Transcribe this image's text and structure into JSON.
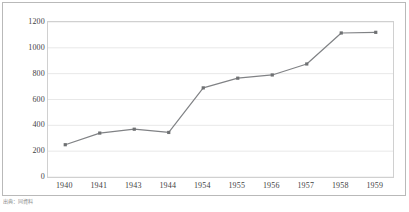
{
  "caption": "出典：同資料",
  "colors": {
    "series_line": "#808285",
    "marker": "#6f7173",
    "gridline": "#e8e8e8",
    "plot_border": "#d0d0d0",
    "figure_border": "#b9b9b9",
    "tick_text": "#3f3f3f",
    "background": "#ffffff"
  },
  "chart_data": {
    "type": "line",
    "title": "",
    "subtitle": "",
    "xlabel": "",
    "ylabel": "",
    "categories": [
      "1940",
      "1941",
      "1943",
      "1944",
      "1954",
      "1955",
      "1956",
      "1957",
      "1958",
      "1959"
    ],
    "values": [
      250,
      340,
      370,
      345,
      690,
      765,
      790,
      875,
      1115,
      1120
    ],
    "series": [
      {
        "name": "series-1",
        "values": [
          250,
          340,
          370,
          345,
          690,
          765,
          790,
          875,
          1115,
          1120
        ]
      }
    ],
    "ylim": [
      0,
      1200
    ],
    "yticks": [
      0,
      200,
      400,
      600,
      800,
      1000,
      1200
    ],
    "ytick_labels": [
      "0",
      "200",
      "400",
      "600",
      "800",
      "1000",
      "1200"
    ],
    "xtick_labels": [
      "1940",
      "1941",
      "1943",
      "1944",
      "1954",
      "1955",
      "1956",
      "1957",
      "1958",
      "1959"
    ],
    "grid": true,
    "grid_axis": "y",
    "legend": false,
    "legend_position": "none",
    "markers": "square",
    "annotations": []
  }
}
